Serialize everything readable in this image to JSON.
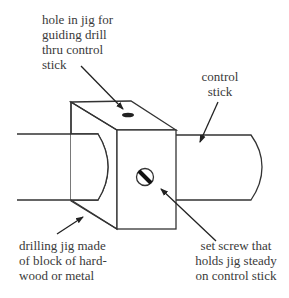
{
  "diagram": {
    "labels": {
      "hole": [
        "hole in jig for",
        "guiding drill",
        "thru control",
        "stick"
      ],
      "control_stick": [
        "control",
        "stick"
      ],
      "jig": [
        "drilling jig made",
        "of block of hard-",
        "wood or metal"
      ],
      "set_screw": [
        "set screw that",
        "holds jig steady",
        "on control stick"
      ]
    },
    "colors": {
      "line": "#333333",
      "background": "#ffffff"
    }
  }
}
